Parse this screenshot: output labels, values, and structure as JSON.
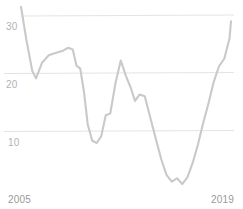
{
  "chart_data": {
    "type": "line",
    "title": "",
    "subtitle": "",
    "xlabel": "",
    "ylabel": "",
    "xlim": [
      2005,
      2019
    ],
    "ylim": [
      0,
      33
    ],
    "grid": true,
    "legend": false,
    "y_ticks": [
      10,
      20,
      30
    ],
    "y_tick_labels": [
      "10",
      "20",
      "30"
    ],
    "x_ticks": [
      2005,
      2019
    ],
    "x_tick_labels": [
      "2005",
      "2019"
    ],
    "series": [
      {
        "name": "value",
        "color": "#c9c9c9",
        "x": [
          2005.0,
          2005.35,
          2005.75,
          2006.0,
          2006.4,
          2006.85,
          2007.3,
          2007.8,
          2008.15,
          2008.45,
          2008.7,
          2008.95,
          2009.2,
          2009.45,
          2009.75,
          2010.05,
          2010.35,
          2010.65,
          2010.95,
          2011.3,
          2011.65,
          2012.0,
          2012.3,
          2012.6,
          2012.9,
          2013.25,
          2013.6,
          2014.0,
          2014.35,
          2014.7,
          2015.05,
          2015.4,
          2015.75,
          2016.1,
          2016.45,
          2016.8,
          2017.15,
          2017.5,
          2017.85,
          2018.2,
          2018.55,
          2018.9,
          2019.0
        ],
        "values": [
          31.6,
          26.0,
          20.5,
          19.2,
          21.9,
          23.2,
          23.6,
          24.0,
          24.5,
          24.2,
          21.4,
          20.9,
          16.8,
          11.2,
          8.4,
          8.0,
          9.2,
          12.8,
          13.1,
          18.4,
          22.3,
          19.6,
          17.7,
          15.3,
          16.4,
          16.1,
          12.6,
          8.6,
          5.2,
          2.5,
          1.3,
          1.9,
          0.9,
          2.1,
          4.6,
          7.8,
          11.5,
          14.9,
          18.6,
          21.3,
          22.6,
          26.1,
          29.1
        ]
      }
    ]
  },
  "axis": {
    "baseline_color": "#4a4a4a",
    "gridline_color": "#e2e2e2",
    "tick_label_color": "#aaaaaa"
  }
}
